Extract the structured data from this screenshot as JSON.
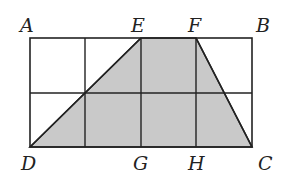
{
  "diagram": {
    "type": "geometry-grid",
    "colors": {
      "stroke": "#222222",
      "shade": "#c9c9c9",
      "background": "#ffffff"
    },
    "rectangle": {
      "x": 30,
      "y": 38,
      "width": 222,
      "height": 109
    },
    "grid": {
      "columns": 4,
      "rows": 2,
      "vertical_lines_x": [
        85,
        141,
        196
      ],
      "horizontal_lines_y": [
        93
      ]
    },
    "shaded_polygon": {
      "name": "trapezoid DEFC",
      "vertices": [
        "D",
        "E",
        "F",
        "C"
      ]
    },
    "points": {
      "A": {
        "label": "A",
        "x": 30,
        "y": 38
      },
      "E": {
        "label": "E",
        "x": 141,
        "y": 38
      },
      "F": {
        "label": "F",
        "x": 196,
        "y": 38
      },
      "B": {
        "label": "B",
        "x": 252,
        "y": 38
      },
      "D": {
        "label": "D",
        "x": 30,
        "y": 147
      },
      "G": {
        "label": "G",
        "x": 141,
        "y": 147
      },
      "H": {
        "label": "H",
        "x": 196,
        "y": 147
      },
      "C": {
        "label": "C",
        "x": 252,
        "y": 147
      }
    },
    "labels": [
      {
        "id": "A",
        "text": "A",
        "x": 20,
        "y": 32
      },
      {
        "id": "E",
        "text": "E",
        "x": 131,
        "y": 32
      },
      {
        "id": "F",
        "text": "F",
        "x": 188,
        "y": 32
      },
      {
        "id": "B",
        "text": "B",
        "x": 256,
        "y": 32
      },
      {
        "id": "D",
        "text": "D",
        "x": 21,
        "y": 170
      },
      {
        "id": "G",
        "text": "G",
        "x": 133,
        "y": 170
      },
      {
        "id": "H",
        "text": "H",
        "x": 188,
        "y": 170
      },
      {
        "id": "C",
        "text": "C",
        "x": 258,
        "y": 170
      }
    ]
  }
}
